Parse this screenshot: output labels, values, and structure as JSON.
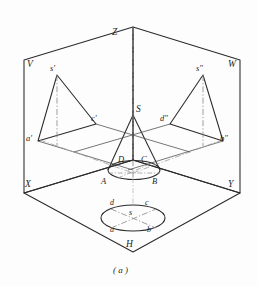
{
  "figure": {
    "caption": "( a )",
    "colors": {
      "solid_line": "#2b2b2b",
      "center_line": "#8d8d8d",
      "hidden_line": "#9a9a9a",
      "background": "#fdfdfd",
      "text": "#1d1d1d"
    },
    "axes": {
      "z": "Z",
      "x": "X",
      "y": "Y",
      "v_plane": "V",
      "w_plane": "W",
      "h_plane": "H"
    },
    "space_cone": {
      "apex": "S",
      "base_points": {
        "front_left": "A",
        "front_right": "B",
        "back_right": "C",
        "back_left": "D"
      }
    },
    "front_view": {
      "apex": "s'",
      "left": "a'",
      "right": "c'"
    },
    "side_view": {
      "apex": "s\"",
      "left": "d\"",
      "right": "b\""
    },
    "top_view": {
      "center": "s",
      "back_left": "d",
      "back_right": "c",
      "front_left": "a",
      "front_right": "b"
    }
  }
}
